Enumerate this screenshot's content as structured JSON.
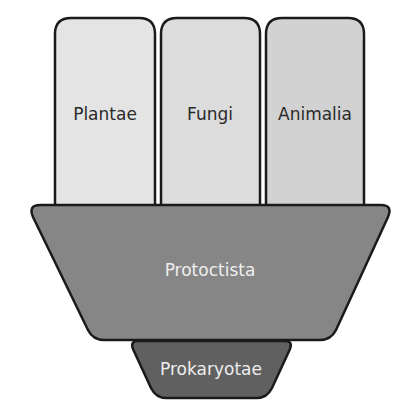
{
  "diagram": {
    "type": "kingdom-classification",
    "kingdoms": [
      {
        "id": "plantae",
        "label": "Plantae",
        "fill": "#e4e4e4"
      },
      {
        "id": "fungi",
        "label": "Fungi",
        "fill": "#dcdcdc"
      },
      {
        "id": "animalia",
        "label": "Animalia",
        "fill": "#d2d2d2"
      }
    ],
    "protoctista": {
      "label": "Protoctista",
      "fill": "#868686",
      "text_color": "#eeeeee"
    },
    "prokaryotae": {
      "label": "Prokaryotae",
      "fill": "#606060",
      "text_color": "#eeeeee"
    },
    "stroke_color": "#1a1a1a",
    "text_color": "#2a2a2a"
  }
}
